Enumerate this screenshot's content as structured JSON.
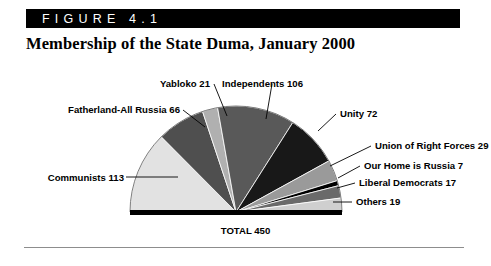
{
  "figure": {
    "tag": "F I G U R E   4 . 1",
    "tag_plain": "FIGURE 4.1",
    "title": "Membership of the State Duma, January 2000",
    "total_label": "TOTAL 450"
  },
  "chart_data": {
    "type": "pie",
    "variant": "semicircle",
    "title": "Membership of the State Duma, January 2000",
    "xlabel": "",
    "ylabel": "",
    "total": 450,
    "total_label": "TOTAL 450",
    "units": "seats",
    "legend": "none-inline-labels",
    "grid": false,
    "categories": [
      "Communists",
      "Fatherland-All Russia",
      "Yabloko",
      "Independents",
      "Unity",
      "Union of Right Forces",
      "Our Home is Russia",
      "Liberal Democrats",
      "Others"
    ],
    "values": [
      113,
      66,
      21,
      106,
      72,
      29,
      7,
      17,
      19
    ],
    "colors": [
      "#e2e2e2",
      "#4f4f4f",
      "#b0b0b0",
      "#595959",
      "#181818",
      "#9a9a9a",
      "#000000",
      "#6a6a6a",
      "#cfcfcf"
    ],
    "slices": [
      {
        "label": "Communists 113",
        "name": "Communists",
        "value": 113,
        "color": "#e2e2e2"
      },
      {
        "label": "Fatherland-All Russia 66",
        "name": "Fatherland-All Russia",
        "value": 66,
        "color": "#4f4f4f"
      },
      {
        "label": "Yabloko 21",
        "name": "Yabloko",
        "value": 21,
        "color": "#b0b0b0"
      },
      {
        "label": "Independents 106",
        "name": "Independents",
        "value": 106,
        "color": "#595959"
      },
      {
        "label": "Unity 72",
        "name": "Unity",
        "value": 72,
        "color": "#181818"
      },
      {
        "label": "Union of Right Forces 29",
        "name": "Union of Right Forces",
        "value": 29,
        "color": "#9a9a9a"
      },
      {
        "label": "Our Home is Russia 7",
        "name": "Our Home is Russia",
        "value": 7,
        "color": "#000000"
      },
      {
        "label": "Liberal Democrats 17",
        "name": "Liberal Democrats",
        "value": 17,
        "color": "#6a6a6a"
      },
      {
        "label": "Others 19",
        "name": "Others",
        "value": 19,
        "color": "#cfcfcf"
      }
    ]
  },
  "labels": {
    "communists": "Communists 113",
    "fatherland": "Fatherland-All Russia 66",
    "yabloko": "Yabloko 21",
    "independents": "Independents 106",
    "unity": "Unity 72",
    "union_right_forces": "Union of Right Forces 29",
    "our_home": "Our Home is Russia 7",
    "liberal_democrats": "Liberal Democrats 17",
    "others": "Others 19"
  }
}
